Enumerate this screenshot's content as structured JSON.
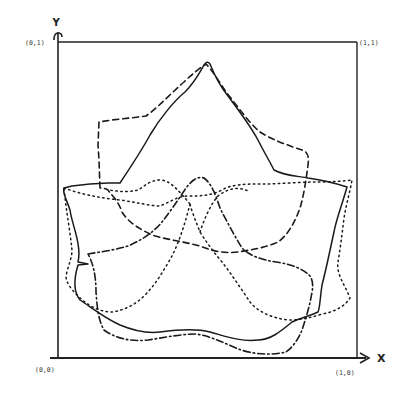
{
  "figure": {
    "axes": {
      "x_label": "X",
      "y_label": "Y"
    },
    "corner_labels": {
      "origin": "(0,0)",
      "top_left": "(0,1)",
      "top_right": "(1,1)",
      "bottom_right": "(1,0)"
    },
    "colors": {
      "ink": "#1a1a1a",
      "background": "#ffffff"
    },
    "curves": [
      {
        "name": "solid-outline",
        "style": "solid"
      },
      {
        "name": "dashed-outline",
        "style": "dashed"
      },
      {
        "name": "dotted-outline",
        "style": "dotted"
      },
      {
        "name": "dash-dot-outline",
        "style": "dash-dot"
      }
    ]
  }
}
